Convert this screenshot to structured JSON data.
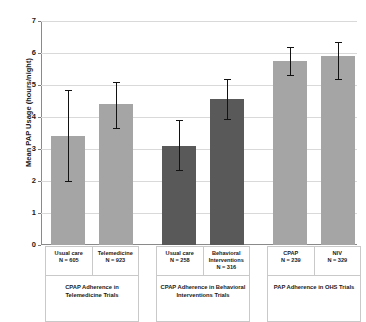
{
  "chart_data": {
    "type": "bar",
    "title": "",
    "xlabel": "",
    "ylabel": "Mean PAP Usage (hours/night)",
    "ylim": [
      0,
      7
    ],
    "ytick_labels": [
      "0",
      "1",
      "2",
      "3",
      "4",
      "5",
      "6",
      "7"
    ],
    "ytick_values": [
      0,
      1,
      2,
      3,
      4,
      5,
      6,
      7
    ],
    "grid": true,
    "legend": "none",
    "error_bars": "95% CI (whiskers with caps)",
    "categories": [
      "Usual care",
      "Telemedicine",
      "Usual care",
      "Behavioral Interventions",
      "CPAP",
      "NIV"
    ],
    "values": [
      3.4,
      4.4,
      3.1,
      4.55,
      5.75,
      5.9
    ],
    "error_low": [
      2.0,
      3.65,
      2.35,
      3.95,
      5.3,
      5.2
    ],
    "error_high": [
      4.85,
      5.1,
      3.9,
      5.2,
      6.2,
      6.35
    ],
    "bars": [
      {
        "label": "Usual care",
        "n_label": "N = 605",
        "value": 3.4,
        "low": 2.0,
        "high": 4.85,
        "color": "#a5a5a5",
        "group": 0
      },
      {
        "label": "Telemedicine",
        "n_label": "N = 923",
        "value": 4.4,
        "low": 3.65,
        "high": 5.1,
        "color": "#a5a5a5",
        "group": 0
      },
      {
        "label": "Usual care",
        "n_label": "N = 258",
        "value": 3.1,
        "low": 2.35,
        "high": 3.9,
        "color": "#595959",
        "group": 1
      },
      {
        "label": "Behavioral Interventions",
        "n_label": "N = 316",
        "value": 4.55,
        "low": 3.95,
        "high": 5.2,
        "color": "#595959",
        "group": 1
      },
      {
        "label": "CPAP",
        "n_label": "N = 239",
        "value": 5.75,
        "low": 5.3,
        "high": 6.2,
        "color": "#a5a5a5",
        "group": 2
      },
      {
        "label": "NIV",
        "n_label": "N = 329",
        "value": 5.9,
        "low": 5.2,
        "high": 6.35,
        "color": "#a5a5a5",
        "group": 2
      }
    ],
    "groups": [
      {
        "caption": "CPAP Adherence in Telemedicine Trials",
        "cells": [
          {
            "name": "Usual care",
            "n": "N = 605"
          },
          {
            "name": "Telemedicine",
            "n": "N = 923"
          }
        ]
      },
      {
        "caption": "CPAP Adherence in Behavioral Interventions Trials",
        "cells": [
          {
            "name": "Usual care",
            "n": "N = 258"
          },
          {
            "name": "Behavioral Interventions",
            "n": "N = 316"
          }
        ]
      },
      {
        "caption": "PAP Adherence in OHS Trials",
        "cells": [
          {
            "name": "CPAP",
            "n": "N = 239"
          },
          {
            "name": "NIV",
            "n": "N = 329"
          }
        ]
      }
    ],
    "colors": {
      "bar_light": "#a5a5a5",
      "bar_dark": "#595959",
      "gridline": "#d9d9d9",
      "axis": "#8a8a8a",
      "error_bar": "#121212",
      "text": "#1a1a1a",
      "background": "#ffffff"
    }
  }
}
